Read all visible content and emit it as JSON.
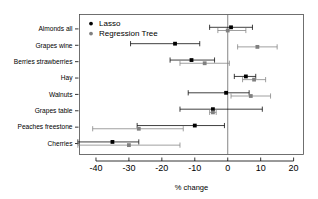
{
  "chart_data": {
    "type": "scatter",
    "title": "",
    "subtitle": "",
    "xlabel": "% change",
    "ylabel": "",
    "xlim": [
      -45,
      23
    ],
    "ylim": [
      0,
      9
    ],
    "grid": false,
    "orientation": "horizontal",
    "reference_line": 0,
    "legend_position": "top-left",
    "xticks": [
      -40,
      -30,
      -20,
      -10,
      0,
      10,
      20
    ],
    "xtick_labels": [
      "-40",
      "-30",
      "-20",
      "-10",
      "0",
      "10",
      "20"
    ],
    "categories": [
      "Almonds all",
      "Grapes wine",
      "Berries strawberries",
      "Hay",
      "Walnuts",
      "Grapes table",
      "Peaches freestone",
      "Cherries"
    ],
    "series": [
      {
        "name": "Lasso",
        "color": "#000000",
        "marker": "filled-square",
        "values": [
          1.0,
          -16.0,
          -11.0,
          5.5,
          -0.5,
          -4.5,
          -10.0,
          -35.0
        ],
        "ci_low": [
          -5.5,
          -29.5,
          -17.5,
          2.0,
          -12.0,
          -14.5,
          -27.5,
          -45.5
        ],
        "ci_high": [
          7.5,
          -8.5,
          -4.0,
          8.5,
          6.5,
          10.5,
          -1.0,
          -27.0
        ]
      },
      {
        "name": "Regression Tree",
        "color": "#808080",
        "marker": "filled-square",
        "values": [
          0.0,
          9.0,
          -7.0,
          8.0,
          7.0,
          -4.5,
          -27.0,
          -30.0
        ],
        "ci_low": [
          -3.0,
          3.0,
          -14.5,
          4.5,
          1.0,
          -5.5,
          -41.0,
          -45.5
        ],
        "ci_high": [
          5.5,
          15.0,
          0.5,
          11.5,
          13.0,
          -3.5,
          -13.5,
          -14.5
        ]
      }
    ]
  },
  "legend": {
    "entries": [
      {
        "label": "Lasso",
        "color": "#000000"
      },
      {
        "label": "Regression Tree",
        "color": "#808080"
      }
    ]
  },
  "axis": {
    "x_title": "% change",
    "x_tick_labels": [
      "-40",
      "-30",
      "-20",
      "-10",
      "0",
      "10",
      "20"
    ],
    "y_tick_labels": [
      "Almonds all",
      "Grapes wine",
      "Berries strawberries",
      "Hay",
      "Walnuts",
      "Grapes table",
      "Peaches freestone",
      "Cherries"
    ]
  }
}
